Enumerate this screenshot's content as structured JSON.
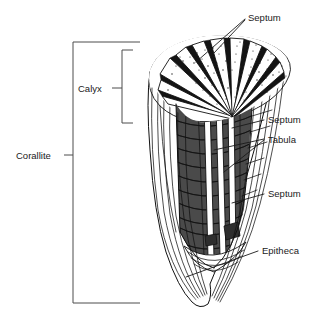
{
  "figure": {
    "background_color": "#ffffff",
    "ink_color": "#111111",
    "shade_color": "#4a4a4a",
    "label_color": "#1a1a1a",
    "width": 323,
    "height": 316
  },
  "labels": {
    "septum_top": "Septum",
    "septum_middle": "Septum",
    "tabula": "Tabula",
    "septum_lower": "Septum",
    "epitheca": "Epitheca",
    "calyx": "Calyx",
    "corallite": "Corallite"
  },
  "brackets": [
    {
      "name": "corallite",
      "label": "Corallite",
      "side": "left",
      "span_top": 42,
      "span_bottom": 303
    },
    {
      "name": "calyx",
      "label": "Calyx",
      "side": "left",
      "span_top": 50,
      "span_bottom": 123
    }
  ],
  "callouts": [
    {
      "name": "septum-top",
      "label": "Septum",
      "text_x": 248,
      "text_y": 21,
      "leaders": 2
    },
    {
      "name": "septum-middle",
      "label": "Septum",
      "text_x": 268,
      "text_y": 123,
      "leaders": 1
    },
    {
      "name": "tabula",
      "label": "Tabula",
      "text_x": 268,
      "text_y": 143,
      "leaders": 2
    },
    {
      "name": "septum-lower",
      "label": "Septum",
      "text_x": 268,
      "text_y": 197,
      "leaders": 1
    },
    {
      "name": "epitheca",
      "label": "Epitheca",
      "text_x": 262,
      "text_y": 254,
      "leaders": 1
    }
  ],
  "anatomy": {
    "parts": [
      "calyx rim",
      "septa",
      "tabulae",
      "epitheca",
      "corallite wall"
    ],
    "septa_count_visible": 11,
    "tabulae_count_visible": 7
  }
}
